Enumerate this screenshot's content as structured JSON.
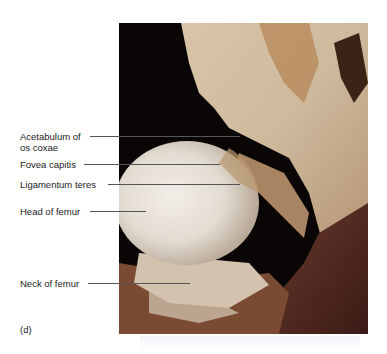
{
  "figure": {
    "panel_letter": "(d)",
    "image_description": "Dissection photograph of the hip joint showing the femoral head within the opened joint capsule",
    "labels": [
      {
        "text": "Acetabulum of\nos coxae",
        "line1": "Acetabulum of",
        "line2": "os coxae"
      },
      {
        "text": "Fovea capitis"
      },
      {
        "text": "Ligamentum teres"
      },
      {
        "text": "Head of femur"
      },
      {
        "text": "Neck of femur"
      }
    ]
  },
  "colors": {
    "background": "#ffffff",
    "label_text": "#222222",
    "leader_line": "#555555",
    "photo_background": "#0a0606",
    "femoral_head": "#e8e2d8",
    "tissue_tan": "#c9b39a",
    "muscle_red": "#5a2a22"
  }
}
